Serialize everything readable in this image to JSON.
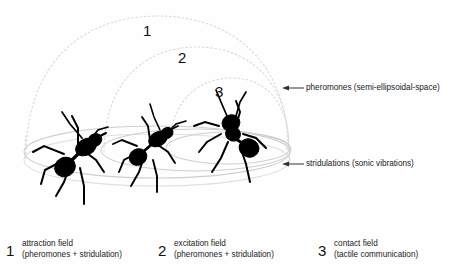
{
  "diagram": {
    "colors": {
      "dome_arc": "#d9d9d9",
      "ground_ellipse": "#cfcfcf",
      "ant_silhouette": "#000000",
      "text": "#1a1a1a",
      "background": "#fefefe",
      "leader_line": "#333333"
    },
    "field_numbers": [
      {
        "id": "1",
        "label": "1"
      },
      {
        "id": "2",
        "label": "2"
      },
      {
        "id": "3",
        "label": "3"
      }
    ],
    "callouts": [
      {
        "name": "pheromones",
        "label": "pheromones (semi-ellipsoidal-space)",
        "points_to": "dome-arcs"
      },
      {
        "name": "stridulations",
        "label": "stridulations (sonic vibrations)",
        "points_to": "ground-ellipses"
      }
    ],
    "legend": [
      {
        "number": "1",
        "title": "attraction field",
        "subtitle": "(pheromones + stridulation)"
      },
      {
        "number": "2",
        "title": "excitation field",
        "subtitle": "(pheromones + stridulation)"
      },
      {
        "number": "3",
        "title": "contact field",
        "subtitle": "(tactile communication)"
      }
    ],
    "ants": [
      {
        "name": "ant-left",
        "field": "1"
      },
      {
        "name": "ant-middle",
        "field": "2"
      },
      {
        "name": "ant-right",
        "field": "3"
      }
    ]
  }
}
